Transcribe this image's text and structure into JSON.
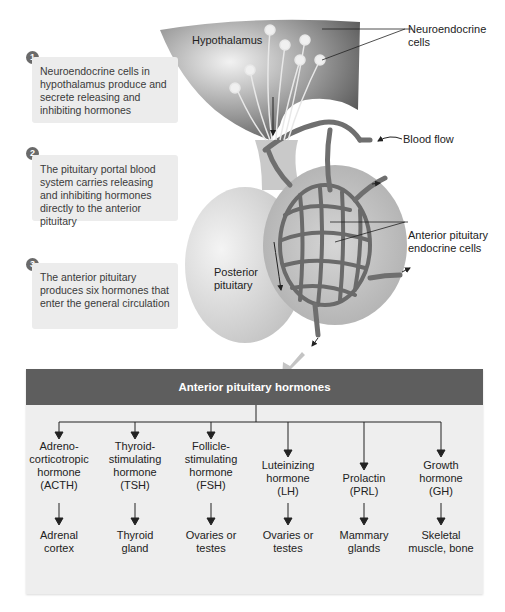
{
  "steps": [
    {
      "number": "1",
      "text": "Neuroendocrine cells in hypothalamus produce and secrete releasing and inhibiting hormones"
    },
    {
      "number": "2",
      "text": "The pituitary portal blood system carries releasing and inhibiting hormones directly to the anterior pituitary"
    },
    {
      "number": "3",
      "text": "The anterior pituitary produces six hormones that enter the general circulation"
    }
  ],
  "labels": {
    "hypothalamus": "Hypothalamus",
    "neuroendocrine_cells_line1": "Neuroendocrine",
    "neuroendocrine_cells_line2": "cells",
    "blood_flow": "Blood flow",
    "anterior_cells_line1": "Anterior pituitary",
    "anterior_cells_line2": "endocrine cells",
    "posterior_line1": "Posterior",
    "posterior_line2": "pituitary"
  },
  "panel": {
    "title": "Anterior pituitary hormones",
    "hormones": [
      {
        "name_lines": [
          "Adreno-",
          "corticotropic",
          "hormone",
          "(ACTH)"
        ],
        "target_lines": [
          "Adrenal",
          "cortex"
        ]
      },
      {
        "name_lines": [
          "Thyroid-",
          "stimulating",
          "hormone",
          "(TSH)"
        ],
        "target_lines": [
          "Thyroid",
          "gland"
        ]
      },
      {
        "name_lines": [
          "Follicle-",
          "stimulating",
          "hormone",
          "(FSH)"
        ],
        "target_lines": [
          "Ovaries or",
          "testes"
        ]
      },
      {
        "name_lines": [
          "Luteinizing",
          "hormone",
          "(LH)"
        ],
        "target_lines": [
          "Ovaries or",
          "testes"
        ]
      },
      {
        "name_lines": [
          "Prolactin",
          "(PRL)"
        ],
        "target_lines": [
          "Mammary",
          "glands"
        ]
      },
      {
        "name_lines": [
          "Growth",
          "hormone",
          "(GH)"
        ],
        "target_lines": [
          "Skeletal",
          "muscle, bone"
        ]
      }
    ]
  },
  "colors": {
    "panel_header": "#5e5e5e",
    "panel_bg": "#eeeeee",
    "step_box_bg": "#ececec",
    "vessel": "#6f6f6f",
    "gland_light": "#d8d8d8"
  }
}
